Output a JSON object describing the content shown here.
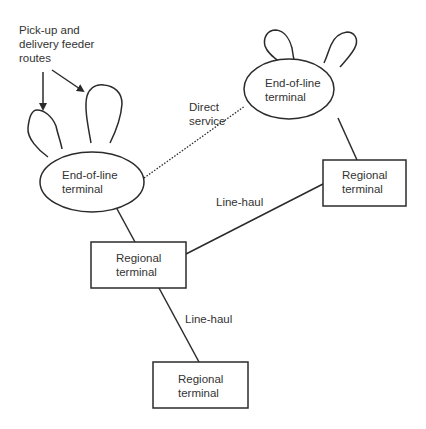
{
  "diagram": {
    "annotations": {
      "feeder_routes_line1": "Pick-up and",
      "feeder_routes_line2": "delivery feeder",
      "feeder_routes_line3": "routes",
      "direct_service_line1": "Direct",
      "direct_service_line2": "service",
      "line_haul_upper": "Line-haul",
      "line_haul_lower": "Line-haul"
    },
    "nodes": [
      {
        "id": "eol_left",
        "type": "ellipse",
        "line1": "End-of-line",
        "line2": "terminal"
      },
      {
        "id": "eol_right",
        "type": "ellipse",
        "line1": "End-of-line",
        "line2": "terminal"
      },
      {
        "id": "regional_right",
        "type": "rect",
        "line1": "Regional",
        "line2": "terminal"
      },
      {
        "id": "regional_middle",
        "type": "rect",
        "line1": "Regional",
        "line2": "terminal"
      },
      {
        "id": "regional_bottom",
        "type": "rect",
        "line1": "Regional",
        "line2": "terminal"
      }
    ],
    "edges": [
      {
        "from": "eol_left",
        "to": "eol_right",
        "style": "dotted",
        "label": "Direct service"
      },
      {
        "from": "eol_left",
        "to": "regional_middle",
        "style": "solid"
      },
      {
        "from": "eol_right",
        "to": "regional_right",
        "style": "solid"
      },
      {
        "from": "regional_middle",
        "to": "regional_right",
        "style": "solid",
        "label": "Line-haul"
      },
      {
        "from": "regional_middle",
        "to": "regional_bottom",
        "style": "solid",
        "label": "Line-haul"
      }
    ],
    "colors": {
      "stroke": "#2b2b2b",
      "text": "#333333",
      "background": "#ffffff"
    }
  }
}
